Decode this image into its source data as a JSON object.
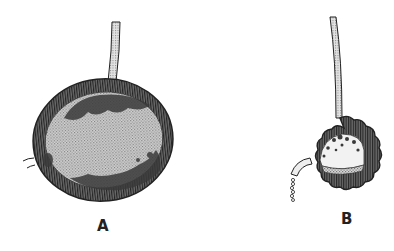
{
  "figure": {
    "panels": [
      {
        "id": "A",
        "label": "A",
        "description": "Large rounded sac on a thin stalk, thick hatched wall enclosing a stippled interior with dark clustered masses"
      },
      {
        "id": "B",
        "label": "B",
        "description": "Smaller contracted sac with scalloped hatched wall on a long stalk, with a curved spout at lower left releasing a beaded stream"
      }
    ],
    "colors": {
      "background": "#ffffff",
      "wall": "#555555",
      "wall_hatch": "#2a2a2a",
      "interior": "#c9c9c9",
      "clusters": "#3a3a3a",
      "stalk": "#bdbdbd",
      "outline": "#222222",
      "label": "#222222"
    }
  }
}
